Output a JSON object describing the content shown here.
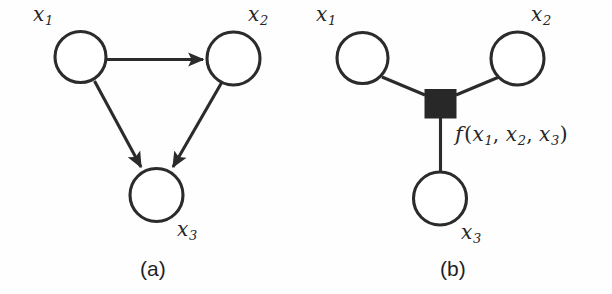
{
  "figure": {
    "background_color": "#fefefe",
    "stroke_color": "#2b2b2b",
    "factor_node_color": "#282828"
  },
  "panel_a": {
    "caption": "(a)",
    "type": "directed-graph",
    "nodes": [
      {
        "id": "x1",
        "label_var": "x",
        "label_sub": "1"
      },
      {
        "id": "x2",
        "label_var": "x",
        "label_sub": "2"
      },
      {
        "id": "x3",
        "label_var": "x",
        "label_sub": "3"
      }
    ],
    "edges": [
      {
        "from": "x1",
        "to": "x2"
      },
      {
        "from": "x1",
        "to": "x3"
      },
      {
        "from": "x2",
        "to": "x3"
      }
    ]
  },
  "panel_b": {
    "caption": "(b)",
    "type": "factor-graph",
    "nodes": [
      {
        "id": "x1",
        "label_var": "x",
        "label_sub": "1"
      },
      {
        "id": "x2",
        "label_var": "x",
        "label_sub": "2"
      },
      {
        "id": "x3",
        "label_var": "x",
        "label_sub": "3"
      }
    ],
    "factor": {
      "id": "f",
      "name": "f",
      "open_paren": "(",
      "close_paren": ")",
      "comma": ",",
      "args": [
        {
          "var": "x",
          "sub": "1"
        },
        {
          "var": "x",
          "sub": "2"
        },
        {
          "var": "x",
          "sub": "3"
        }
      ],
      "full_label": "f(x1, x2, x3)"
    },
    "edges": [
      {
        "from": "f",
        "to": "x1"
      },
      {
        "from": "f",
        "to": "x2"
      },
      {
        "from": "f",
        "to": "x3"
      }
    ]
  }
}
